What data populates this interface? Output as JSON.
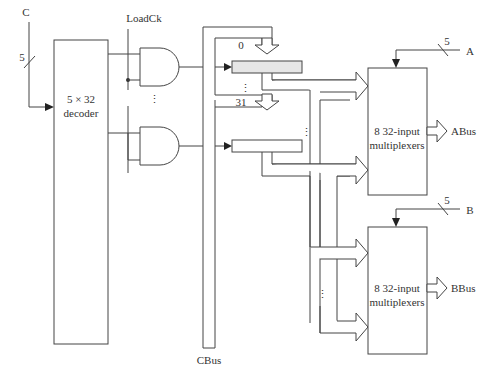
{
  "inputs": {
    "c_label": "C",
    "c_width": "5",
    "loadck_label": "LoadCk",
    "a_label": "A",
    "a_width": "5",
    "b_label": "B",
    "b_width": "5"
  },
  "decoder": {
    "line1": "5 × 32",
    "line2": "decoder"
  },
  "registers": [
    {
      "label": "0",
      "fill": "#e6e6e6"
    },
    {
      "label": "31",
      "fill": "#ffffff"
    }
  ],
  "ellipsis": "⋮",
  "cbus_label": "CBus",
  "mux_a": {
    "line1": "8 32-input",
    "line2": "multiplexers",
    "output_label": "ABus"
  },
  "mux_b": {
    "line1": "8 32-input",
    "line2": "multiplexers",
    "output_label": "BBus"
  }
}
